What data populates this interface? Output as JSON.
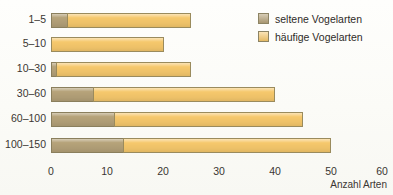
{
  "chart_data": {
    "type": "bar",
    "orientation": "horizontal",
    "stacked": true,
    "title": "",
    "xlabel": "Anzahl Arten",
    "ylabel": "",
    "categories": [
      "1–5",
      "5–10",
      "10–30",
      "30–60",
      "60–100",
      "100–150"
    ],
    "xlim": [
      0,
      60
    ],
    "xticks": [
      0,
      10,
      20,
      30,
      40,
      50,
      60
    ],
    "xticklabels": [
      "0",
      "10",
      "20",
      "30",
      "40",
      "50",
      "60"
    ],
    "grid": false,
    "legend_position": "top-right",
    "series": [
      {
        "name": "seltene Vogelarten",
        "color": "#b6a37a",
        "values": [
          3,
          0,
          1,
          7.7,
          11.4,
          13
        ]
      },
      {
        "name": "häufige Vogelarten",
        "color": "#f6c86c",
        "values": [
          22,
          20,
          24,
          32.3,
          33.6,
          37
        ]
      }
    ],
    "totals": [
      25,
      20,
      25,
      40,
      45,
      50
    ]
  },
  "legend": {
    "items": [
      {
        "label": "seltene Vogelarten",
        "color": "#b6a37a"
      },
      {
        "label": "häufige Vogelarten",
        "color": "#f6c86c"
      }
    ]
  },
  "axis": {
    "x_title": "Anzahl Arten"
  }
}
